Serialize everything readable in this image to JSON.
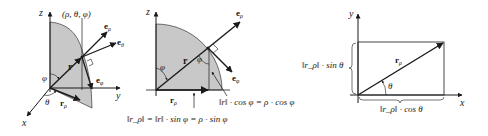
{
  "colors": {
    "ink": "#1a1a1a",
    "shade": "#c8c8c8",
    "background": "#ffffff"
  },
  "diagram1": {
    "axis_z": "z",
    "axis_y": "y",
    "axis_x": "x",
    "point_label": "(ρ, θ, φ)",
    "vector_r": "r",
    "vector_r_rho": "r",
    "vector_r_rho_sub": "ρ",
    "basis_e_rho": "e",
    "basis_e_rho_sub": "ρ",
    "basis_e_theta": "e",
    "basis_e_theta_sub": "θ",
    "basis_e_phi": "e",
    "basis_e_phi_sub": "φ",
    "angle_phi": "φ",
    "angle_theta": "θ"
  },
  "diagram2": {
    "axis_z": "z",
    "vector_r": "r",
    "vector_r_rho": "r",
    "vector_r_rho_sub": "ρ",
    "basis_e_rho": "e",
    "basis_e_rho_sub": "ρ",
    "basis_e_phi": "e",
    "basis_e_phi_sub": "φ",
    "angle_phi_top": "φ",
    "angle_phi_point": "φ",
    "height_formula": "‖r‖ · cos φ = ρ · cos φ",
    "projection_formula": "‖r_ρ‖ = ‖r‖ · sin φ = ρ · sin φ"
  },
  "diagram3": {
    "axis_y": "y",
    "axis_x": "x",
    "vector_r_rho": "r",
    "vector_r_rho_sub": "ρ",
    "angle_theta": "θ",
    "vertical_formula": "‖r_ρ‖ · sin θ",
    "horizontal_formula": "‖r_ρ‖ · cos θ"
  }
}
